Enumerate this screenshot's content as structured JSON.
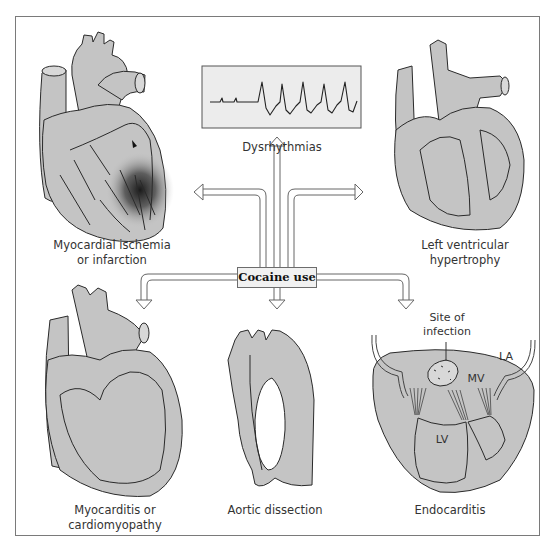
{
  "center": {
    "label": "Cocaine use"
  },
  "panels": [
    {
      "id": "ischemia",
      "label_line1": "Myocardial ischemia",
      "label_line2": "or infarction"
    },
    {
      "id": "dysrhythmias",
      "label_line1": "Dysrhythmias"
    },
    {
      "id": "lvh",
      "label_line1": "Left ventricular",
      "label_line2": "hypertrophy"
    },
    {
      "id": "myocarditis",
      "label_line1": "Myocarditis or",
      "label_line2": "cardiomyopathy"
    },
    {
      "id": "aortic",
      "label_line1": "Aortic dissection"
    },
    {
      "id": "endocarditis",
      "label_line1": "Endocarditis"
    }
  ],
  "endocarditis_annotations": {
    "site_line1": "Site of",
    "site_line2": "infection",
    "la": "LA",
    "mv": "MV",
    "lv": "LV"
  },
  "colors": {
    "tissue_fill": "#c4c4c4",
    "outline": "#2a2a2a",
    "frame": "#7a7a7a",
    "box_fill": "#f1f1f1",
    "ecg_fill": "#ececec",
    "ischemia_shade": "#1a1a1a"
  }
}
